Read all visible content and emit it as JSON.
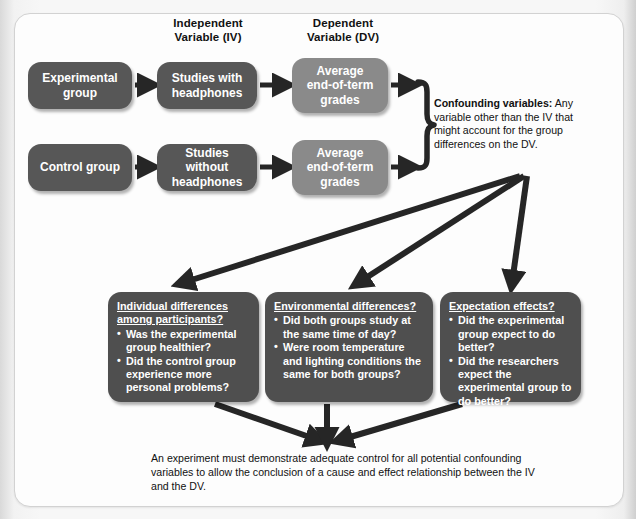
{
  "figure": {
    "columns": {
      "iv": "Independent\nVariable (IV)",
      "iv_line1": "Independent",
      "iv_line2": "Variable (IV)",
      "dv_line1": "Dependent",
      "dv_line2": "Variable (DV)"
    },
    "flow": {
      "experimental_group": "Experimental\ngroup",
      "control_group": "Control group",
      "iv_experimental": "Studies with\nheadphones",
      "iv_control": "Studies without\nheadphones",
      "dv_experimental": "Average\nend-of-term\ngrades",
      "dv_control": "Average\nend-of-term\ngrades"
    },
    "confounding": {
      "lead": "Confounding variables:",
      "body": " Any variable other than the IV that might account for the group differences on the DV."
    },
    "question_boxes": [
      {
        "heading": "Individual differences among participants?",
        "items": [
          "Was the experimental group healthier?",
          "Did the control group experience more personal problems?"
        ]
      },
      {
        "heading": "Environmental differences?",
        "items": [
          "Did both groups study at the same time of day?",
          "Were room temperature and lighting conditions the same for both groups?"
        ]
      },
      {
        "heading": "Expectation effects?",
        "items": [
          "Did the experimental group expect to do better?",
          "Did the researchers expect the experimental group to do better?"
        ]
      }
    ],
    "caption": "An experiment must demonstrate adequate control for all potential confounding variables to allow the conclusion of a cause and effect relationship between the IV and the DV.",
    "colors": {
      "box_dark": "#575757",
      "box_light": "#8a8a8a",
      "question_box": "#4f4f4f",
      "arrow": "#262626",
      "panel_background": "#fdfdfd",
      "page_background": "#e9e9e9",
      "text_on_box": "#ffffff",
      "text_body": "#111111"
    }
  }
}
